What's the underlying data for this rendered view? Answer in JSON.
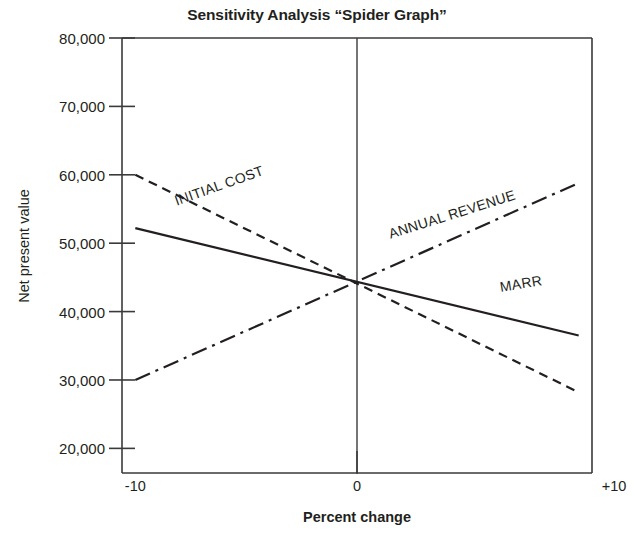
{
  "chart_data": {
    "type": "line",
    "title": "Sensitivity Analysis “Spider Graph”",
    "xlabel": "Percent change",
    "ylabel": "Net present value",
    "xlim": [
      -10.6,
      10.6
    ],
    "ylim": [
      16400,
      80000
    ],
    "x": [
      -10,
      10
    ],
    "xticks": [
      -10,
      0,
      10
    ],
    "xtick_labels": [
      "-10",
      "0",
      "+10"
    ],
    "yticks": [
      20000,
      30000,
      40000,
      50000,
      60000,
      70000,
      80000
    ],
    "ytick_labels": [
      "20,000",
      "30,000",
      "40,000",
      "50,000",
      "60,000",
      "70,000",
      "80,000"
    ],
    "grid": false,
    "legend": "inline-labels",
    "base_point": {
      "x": 0,
      "y": 44700
    },
    "series": [
      {
        "name": "INITIAL COST",
        "label": "INITIAL COST",
        "style": "dashed",
        "color": "#231f20",
        "values": [
          60000,
          28200
        ],
        "label_angle_deg": -19.5
      },
      {
        "name": "ANNUAL REVENUE",
        "label": "ANNUAL REVENUE",
        "style": "dash-dot",
        "color": "#231f20",
        "values": [
          30000,
          58800
        ],
        "label_angle_deg": -17.5
      },
      {
        "name": "MARR",
        "label": "MARR",
        "style": "solid",
        "color": "#231f20",
        "values": [
          52200,
          36500
        ],
        "label_angle_deg": -9.5
      }
    ]
  }
}
